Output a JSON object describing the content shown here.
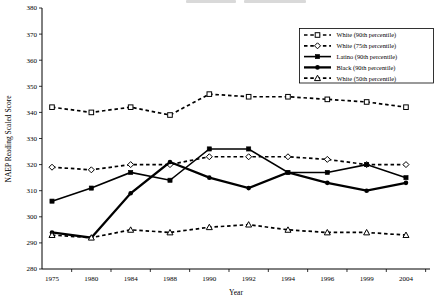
{
  "chart_data": {
    "type": "line",
    "title": "",
    "xlabel": "Year",
    "ylabel": "NAEP Reading Scaled Score",
    "ylim": [
      280,
      380
    ],
    "ytick_step": 10,
    "grid": false,
    "legend_position": "top-right",
    "categories": [
      "1975",
      "1980",
      "1984",
      "1988",
      "1990",
      "1992",
      "1994",
      "1996",
      "1999",
      "2004"
    ],
    "series": [
      {
        "name": "White (90th percentile)",
        "line_style": "dashed",
        "marker": "open-square",
        "values": [
          342,
          340,
          342,
          339,
          347,
          346,
          346,
          345,
          344,
          342
        ]
      },
      {
        "name": "White (75th percentile)",
        "line_style": "dashed",
        "marker": "open-diamond",
        "values": [
          319,
          318,
          320,
          320,
          323,
          323,
          323,
          322,
          320,
          320
        ]
      },
      {
        "name": "Latino (90th percentile)",
        "line_style": "solid",
        "marker": "filled-square",
        "values": [
          306,
          311,
          317,
          314,
          326,
          326,
          317,
          317,
          320,
          315
        ]
      },
      {
        "name": "Black (90th percentile)",
        "line_style": "solid-thick",
        "marker": "filled-circle",
        "values": [
          294,
          292,
          309,
          321,
          315,
          311,
          317,
          313,
          310,
          313
        ]
      },
      {
        "name": "White (50th percentile)",
        "line_style": "dashed",
        "marker": "open-triangle",
        "values": [
          293,
          292,
          295,
          294,
          296,
          297,
          295,
          294,
          294,
          293
        ]
      }
    ],
    "colors": {
      "line": "#000000",
      "background": "#ffffff"
    }
  }
}
